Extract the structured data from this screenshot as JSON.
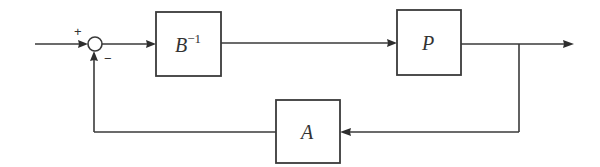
{
  "diagram": {
    "type": "feedback-block-diagram",
    "blocks": [
      {
        "id": "b_inv",
        "label": "B",
        "superscript": "−1",
        "x": 156,
        "y": 12,
        "w": 65,
        "h": 64
      },
      {
        "id": "p",
        "label": "P",
        "superscript": "",
        "x": 397,
        "y": 10,
        "w": 64,
        "h": 65
      },
      {
        "id": "a",
        "label": "A",
        "superscript": "",
        "x": 276,
        "y": 100,
        "w": 64,
        "h": 63
      }
    ],
    "summing_junction": {
      "cx": 95,
      "cy": 44,
      "r": 7,
      "plus_sign": "+",
      "minus_sign": "−"
    },
    "signals": {
      "input_start_x": 35,
      "main_y": 44,
      "branch_x": 519,
      "output_end_x": 574,
      "feedback_y": 132
    },
    "colors": {
      "line": "#3a3a3a",
      "background": "#ffffff",
      "text": "#333333"
    }
  }
}
